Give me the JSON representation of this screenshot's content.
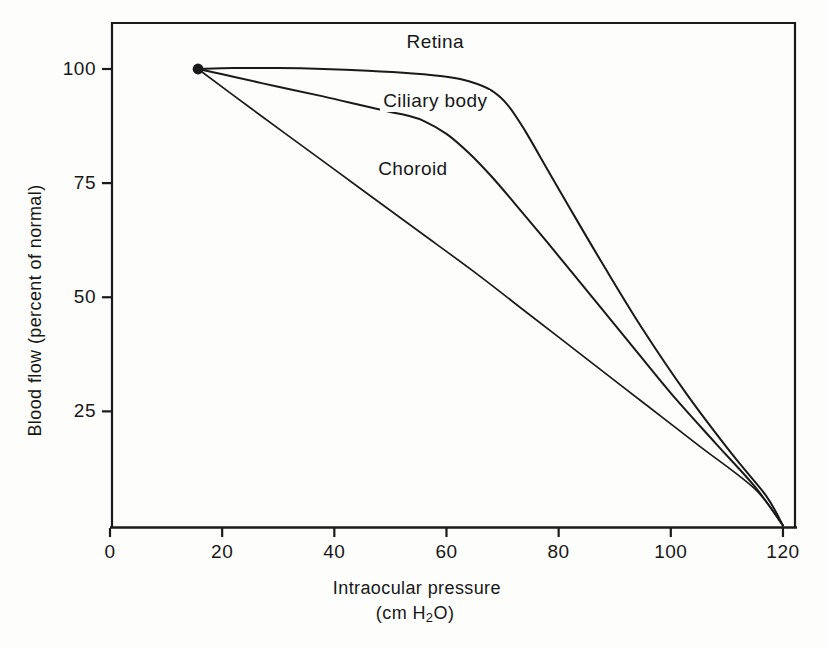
{
  "chart_data": {
    "type": "line",
    "title": "",
    "xlabel": "Intraocular pressure",
    "xunits": "(cm H2O)",
    "ylabel": "Blood flow (percent of normal)",
    "xlim": [
      0,
      125
    ],
    "ylim": [
      0,
      112
    ],
    "grid": false,
    "legend_position": "inline-curve-labels",
    "xticks": [
      0,
      20,
      40,
      60,
      80,
      100,
      120
    ],
    "xtick_labels": [
      "0",
      "20",
      "40",
      "60",
      "80",
      "100",
      "120"
    ],
    "yticks": [
      25,
      50,
      75,
      100
    ],
    "ytick_labels": [
      "25",
      "50",
      "75",
      "100"
    ],
    "origin_marker": {
      "x": 15.7,
      "y": 100,
      "style": "filled-circle"
    },
    "series": [
      {
        "name": "Retina",
        "label": "Retina",
        "label_x": 58,
        "label_y": 106,
        "points": [
          [
            15.7,
            100.0
          ],
          [
            22,
            100.2
          ],
          [
            30,
            100.2
          ],
          [
            38,
            100.0
          ],
          [
            46,
            99.6
          ],
          [
            54,
            99.0
          ],
          [
            60,
            98.3
          ],
          [
            64,
            97.3
          ],
          [
            68,
            95.3
          ],
          [
            71,
            92.0
          ],
          [
            74,
            86.5
          ],
          [
            78,
            78.0
          ],
          [
            82,
            69.5
          ],
          [
            88,
            57.0
          ],
          [
            95,
            43.0
          ],
          [
            103,
            28.5
          ],
          [
            111,
            15.5
          ],
          [
            117,
            6.5
          ],
          [
            120,
            0.0
          ]
        ]
      },
      {
        "name": "Ciliary body",
        "label": "Ciliary body",
        "label_x": 58,
        "label_y": 93,
        "points": [
          [
            15.7,
            100.0
          ],
          [
            22,
            98.3
          ],
          [
            30,
            96.1
          ],
          [
            38,
            94.0
          ],
          [
            45,
            92.0
          ],
          [
            50,
            90.6
          ],
          [
            53,
            89.8
          ],
          [
            56,
            88.6
          ],
          [
            60,
            85.8
          ],
          [
            64,
            81.6
          ],
          [
            68,
            76.5
          ],
          [
            72,
            70.8
          ],
          [
            78,
            62.0
          ],
          [
            85,
            51.5
          ],
          [
            92,
            41.0
          ],
          [
            100,
            29.0
          ],
          [
            108,
            18.0
          ],
          [
            115,
            8.5
          ],
          [
            120,
            0.0
          ]
        ]
      },
      {
        "name": "Choroid",
        "label": "Choroid",
        "label_x": 54,
        "label_y": 78,
        "points": [
          [
            15.7,
            100.0
          ],
          [
            25,
            91.5
          ],
          [
            35,
            82.5
          ],
          [
            45,
            73.5
          ],
          [
            55,
            64.5
          ],
          [
            65,
            55.5
          ],
          [
            75,
            46.0
          ],
          [
            85,
            36.5
          ],
          [
            95,
            27.0
          ],
          [
            105,
            17.5
          ],
          [
            115,
            8.0
          ],
          [
            120,
            0.0
          ]
        ]
      }
    ]
  },
  "style": {
    "line_color": "#1a1a1a",
    "axis_color": "#1a1a1a",
    "background": "#fdfdfc",
    "text_color": "#171717"
  }
}
